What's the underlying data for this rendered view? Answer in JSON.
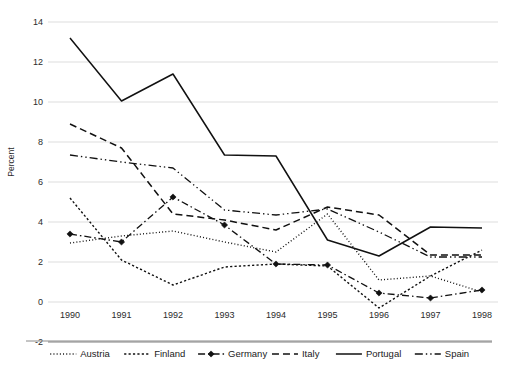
{
  "chart_data": {
    "type": "line",
    "title": "",
    "xlabel": "",
    "ylabel": "Percent",
    "x": [
      1990,
      1991,
      1992,
      1993,
      1994,
      1995,
      1996,
      1997,
      1998
    ],
    "categories": [
      "1990",
      "1991",
      "1992",
      "1993",
      "1994",
      "1995",
      "1996",
      "1997",
      "1998"
    ],
    "ylim": [
      -2,
      14
    ],
    "yticks": [
      -2,
      0,
      2,
      4,
      6,
      8,
      10,
      12,
      14
    ],
    "yticklabels": [
      "-2",
      "0",
      "2",
      "4",
      "6",
      "8",
      "10",
      "12",
      "14"
    ],
    "grid": "horizontal",
    "legend_position": "bottom",
    "series": [
      {
        "name": "Austria",
        "style": "dotted",
        "marker": "none",
        "values": [
          2.95,
          3.3,
          3.55,
          3.0,
          2.5,
          4.4,
          1.1,
          1.3,
          0.5
        ]
      },
      {
        "name": "Finland",
        "style": "dashed-fine",
        "marker": "none",
        "values": [
          5.2,
          2.1,
          0.85,
          1.75,
          1.9,
          1.8,
          -0.3,
          1.3,
          2.6
        ]
      },
      {
        "name": "Germany",
        "style": "dash-dot",
        "marker": "diamond",
        "values": [
          3.4,
          3.0,
          5.25,
          3.85,
          1.9,
          1.85,
          0.45,
          0.2,
          0.6
        ]
      },
      {
        "name": "Italy",
        "style": "dashed",
        "marker": "none",
        "values": [
          8.9,
          7.7,
          4.4,
          4.1,
          3.6,
          4.75,
          4.35,
          2.35,
          2.35
        ]
      },
      {
        "name": "Portugal",
        "style": "solid",
        "marker": "none",
        "values": [
          13.2,
          10.05,
          11.4,
          7.35,
          7.3,
          3.1,
          2.3,
          3.75,
          3.7
        ]
      },
      {
        "name": "Spain",
        "style": "dash-dot-dot",
        "marker": "none",
        "values": [
          7.35,
          7.0,
          6.7,
          4.6,
          4.35,
          4.65,
          3.5,
          2.25,
          2.25
        ]
      }
    ]
  },
  "axis": {
    "y_title": "Percent"
  },
  "legend": {
    "entries": [
      {
        "label": "Austria"
      },
      {
        "label": "Finland"
      },
      {
        "label": "Germany"
      },
      {
        "label": "Italy"
      },
      {
        "label": "Portugal"
      },
      {
        "label": "Spain"
      }
    ]
  },
  "colors": {
    "line": "#111111",
    "grid": "#d9d9d9",
    "axis": "#808080",
    "background": "#ffffff"
  }
}
